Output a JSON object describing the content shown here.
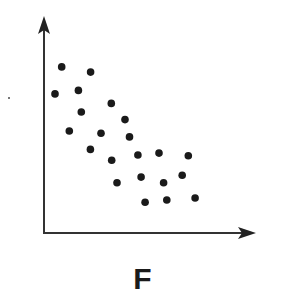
{
  "chart_data": {
    "type": "scatter",
    "title": "",
    "panel_label": "F",
    "xlabel": "",
    "ylabel": "",
    "xlim": [
      0,
      100
    ],
    "ylim": [
      0,
      100
    ],
    "grid": false,
    "legend": null,
    "axes_style": "arrow-tipped x and y axes, no ticks or tick labels",
    "trend": "negative correlation",
    "series": [
      {
        "name": "points",
        "marker": "filled-circle",
        "color": "#1a1a1a",
        "x": [
          8.4,
          22.1,
          5.2,
          16.3,
          31.9,
          17.7,
          38.4,
          12.0,
          27.0,
          40.5,
          22.0,
          32.1,
          44.5,
          54.5,
          68.4,
          34.6,
          46.0,
          56.7,
          65.5,
          47.9,
          58.2,
          71.6
        ],
        "y": [
          76.9,
          74.5,
          64.4,
          66.0,
          60.0,
          56.0,
          52.5,
          47.2,
          46.2,
          44.5,
          38.7,
          33.7,
          36.1,
          37.0,
          35.8,
          23.3,
          25.9,
          23.3,
          26.7,
          14.2,
          15.3,
          16.2
        ]
      }
    ]
  },
  "figure": {
    "label": "F",
    "axis_color": "#333333",
    "point_color": "#1a1a1a"
  }
}
